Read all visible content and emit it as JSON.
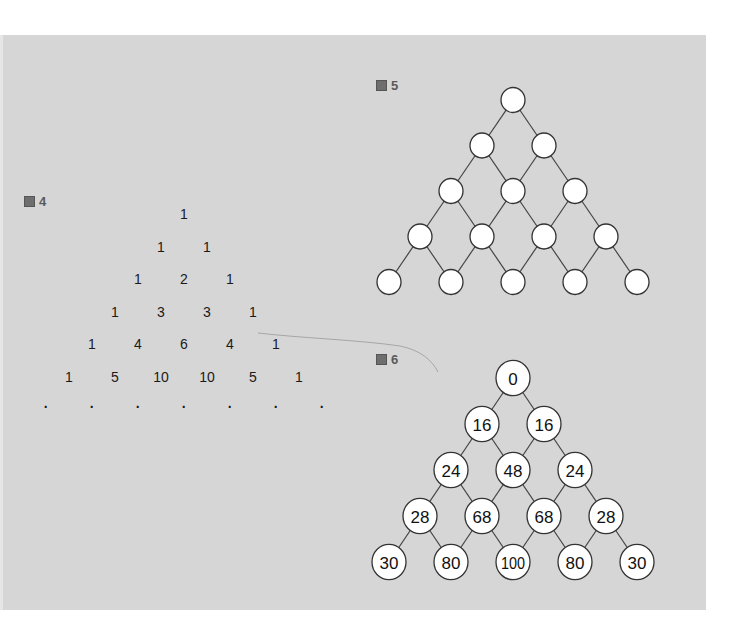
{
  "figures": {
    "fig4": {
      "label": "圖 4",
      "label_char": "圖",
      "label_num": "4",
      "title": "Pascal's triangle",
      "rows": [
        [
          "1"
        ],
        [
          "1",
          "1"
        ],
        [
          "1",
          "2",
          "1"
        ],
        [
          "1",
          "3",
          "3",
          "1"
        ],
        [
          "1",
          "4",
          "6",
          "4",
          "1"
        ],
        [
          "1",
          "5",
          "10",
          "10",
          "5",
          "1"
        ],
        [
          "·",
          "·",
          "·",
          "·",
          "·",
          "·",
          "·"
        ]
      ]
    },
    "fig5": {
      "label_char": "圖",
      "label_num": "5",
      "title": "Empty node lattice",
      "rows": [
        1,
        2,
        3,
        4,
        5
      ]
    },
    "fig6": {
      "label_char": "圖",
      "label_num": "6",
      "title": "Numbered node lattice",
      "rows": [
        [
          "0"
        ],
        [
          "16",
          "16"
        ],
        [
          "24",
          "48",
          "24"
        ],
        [
          "28",
          "68",
          "68",
          "28"
        ],
        [
          "30",
          "80",
          "100",
          "80",
          "30"
        ]
      ]
    }
  },
  "colors": {
    "panel_bg": "#d6d6d6",
    "node_fill": "#ffffff",
    "node_stroke": "#333333",
    "text": "#1a1a1a",
    "label": "#5a5a5a"
  }
}
